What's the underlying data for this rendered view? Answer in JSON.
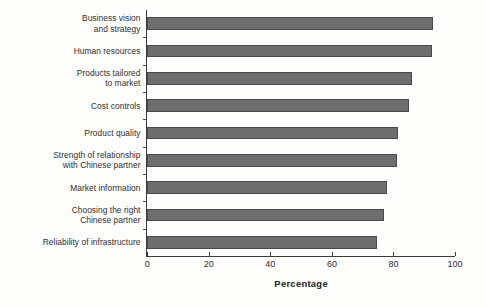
{
  "chart_data": {
    "type": "bar",
    "orientation": "horizontal",
    "title": "",
    "xlabel": "Percentage",
    "ylabel": "",
    "xlim": [
      0,
      100
    ],
    "xticks": [
      0,
      20,
      40,
      60,
      80,
      100
    ],
    "xticklabels": [
      "0",
      "20",
      "40",
      "60",
      "80",
      "100"
    ],
    "grid": false,
    "legend": null,
    "bar_color": "#6e6e6e",
    "bar_edge_color": "#4a4a4a",
    "axis_color": "#3a3a3a",
    "categories": [
      "Business vision\nand strategy",
      "Human resources",
      "Products tailored\nto market",
      "Cost controls",
      "Product quality",
      "Strength of relationship\nwith Chinese partner",
      "Market information",
      "Choosing the right\nChinese partner",
      "Reliability of infrastructure"
    ],
    "values": [
      93,
      92.5,
      86,
      85,
      81.5,
      81,
      78,
      77,
      74.5
    ]
  }
}
